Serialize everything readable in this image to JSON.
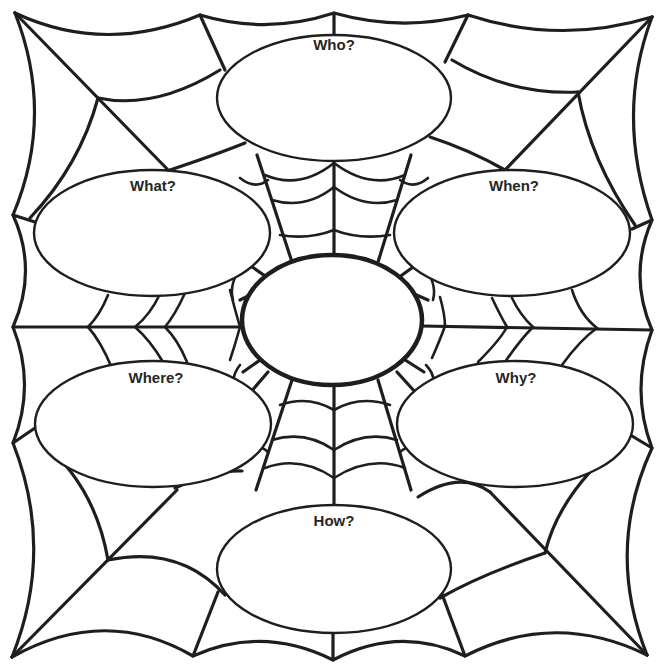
{
  "worksheet": {
    "type": "graphic organizer",
    "style": "spider web",
    "colors": {
      "ink": "#1e1e1e",
      "paper": "#ffffff",
      "label_text": "#262626"
    },
    "center": {
      "label": "",
      "content": ""
    },
    "questions": [
      {
        "id": "who",
        "label": "Who?",
        "answer": ""
      },
      {
        "id": "what",
        "label": "What?",
        "answer": ""
      },
      {
        "id": "when",
        "label": "When?",
        "answer": ""
      },
      {
        "id": "where",
        "label": "Where?",
        "answer": ""
      },
      {
        "id": "why",
        "label": "Why?",
        "answer": ""
      },
      {
        "id": "how",
        "label": "How?",
        "answer": ""
      }
    ]
  }
}
